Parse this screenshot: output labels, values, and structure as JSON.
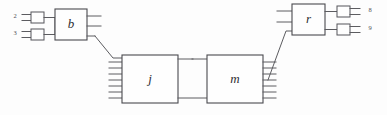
{
  "diagram": {
    "canvas": {
      "width": 387,
      "height": 115,
      "background": "#fdfdfd"
    },
    "colors": {
      "wire": "#5c5c60",
      "box_stroke": "#4a4a4f",
      "box_fill": "#fefefe",
      "label": "#2e2e33"
    },
    "blocks": [
      {
        "id": "b",
        "label": "b",
        "x": 55,
        "y": 9,
        "width": 32,
        "height": 31,
        "left_ports": 2,
        "right_ports": 3
      },
      {
        "id": "j",
        "label": "j",
        "x": 122,
        "y": 55,
        "width": 56,
        "height": 48,
        "left_ports": 7,
        "right_ports": 2
      },
      {
        "id": "m",
        "label": "m",
        "x": 207,
        "y": 55,
        "width": 56,
        "height": 48,
        "left_ports": 2,
        "right_ports": 7
      },
      {
        "id": "r",
        "label": "r",
        "x": 292,
        "y": 4,
        "width": 33,
        "height": 31,
        "left_ports": 2,
        "right_ports": 2
      }
    ],
    "terminals": [
      {
        "id": "t2",
        "label": "2",
        "label_x": 15,
        "label_y": 17,
        "box_x": 31,
        "box_y": 12,
        "box_w": 13,
        "box_h": 11,
        "side": "left"
      },
      {
        "id": "t3",
        "label": "3",
        "label_x": 15,
        "label_y": 34,
        "box_x": 31,
        "box_y": 29,
        "box_w": 13,
        "box_h": 11,
        "side": "left"
      },
      {
        "id": "t8",
        "label": "8",
        "label_x": 370,
        "label_y": 11,
        "box_x": 337,
        "box_y": 6,
        "box_w": 13,
        "box_h": 11,
        "side": "right"
      },
      {
        "id": "t9",
        "label": "9",
        "label_x": 370,
        "label_y": 29,
        "box_x": 337,
        "box_y": 24,
        "box_w": 13,
        "box_h": 11,
        "side": "right"
      }
    ],
    "connections": [
      {
        "id": "b-to-j",
        "from": "b",
        "to": "j",
        "kind": "diagonal"
      },
      {
        "id": "j-to-m",
        "from": "j",
        "to": "m",
        "kind": "direct"
      },
      {
        "id": "m-to-r",
        "from": "m",
        "to": "r",
        "kind": "diagonal"
      }
    ]
  }
}
